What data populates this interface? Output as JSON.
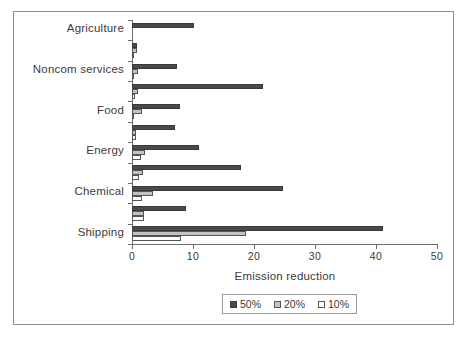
{
  "chart_data": {
    "type": "bar",
    "orientation": "horizontal",
    "title": "",
    "xlabel": "Emission reduction",
    "ylabel": "",
    "xlim": [
      0,
      50
    ],
    "xticks": [
      0,
      10,
      20,
      30,
      40,
      50
    ],
    "xticklabels": [
      "0",
      "10",
      "20",
      "30",
      "40",
      "50"
    ],
    "grid": false,
    "legend_position": "bottom-center",
    "legend": [
      "50%",
      "20%",
      "10%"
    ],
    "categories": [
      "Agriculture",
      "",
      "Noncom services",
      "",
      "Food",
      "",
      "Energy",
      "",
      "Chemical",
      "",
      "Shipping"
    ],
    "series": [
      {
        "name": "50%",
        "color": "#4a4a4a",
        "values": [
          10.2,
          0.9,
          7.3,
          21.4,
          7.8,
          7.0,
          11.0,
          17.9,
          24.8,
          8.9,
          41.2
        ]
      },
      {
        "name": "20%",
        "color": "#c2c2c2",
        "values": [
          0.0,
          0.8,
          1.0,
          1.0,
          1.6,
          0.7,
          2.2,
          1.8,
          3.4,
          2.0,
          18.7
        ]
      },
      {
        "name": "10%",
        "color": "#ffffff",
        "values": [
          0.0,
          0.4,
          0.4,
          0.5,
          0.4,
          0.6,
          1.4,
          1.2,
          1.6,
          1.9,
          8.0
        ]
      }
    ]
  },
  "axis": {
    "x_title": "Emission reduction",
    "ticklabels": [
      "0",
      "10",
      "20",
      "30",
      "40",
      "50"
    ]
  },
  "legend": {
    "items": [
      {
        "label": "50%",
        "swatch": "dark-swatch"
      },
      {
        "label": "20%",
        "swatch": "gray-swatch"
      },
      {
        "label": "10%",
        "swatch": "white-swatch"
      }
    ]
  },
  "colors": {
    "series_50": "#4a4a4a",
    "series_20": "#c2c2c2",
    "series_10": "#ffffff",
    "axis": "#6d6d6d",
    "frame": "#8e8e8e",
    "text": "#3a3a3a",
    "background": "#ffffff"
  }
}
